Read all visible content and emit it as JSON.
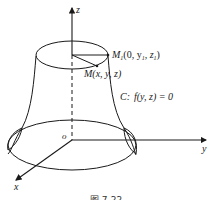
{
  "figure": {
    "axes": {
      "z": "z",
      "y": "y",
      "x": "x",
      "origin": "o"
    },
    "points": {
      "m1_label": "M",
      "m1_sub": "1",
      "m1_coords_open": "(0, y",
      "m1_y_sub": "1",
      "m1_mid": ", z",
      "m1_z_sub": "1",
      "m1_close": ")",
      "m_label": "M(x, y, z)"
    },
    "curve": {
      "name": "C:",
      "equation": "f(y, z) = 0"
    },
    "caption": "图 7-22"
  }
}
